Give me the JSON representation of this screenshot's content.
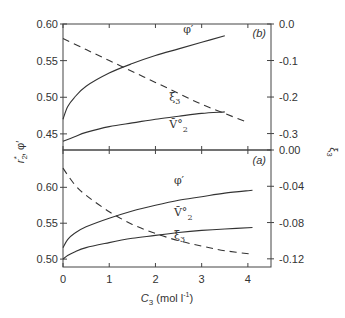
{
  "chart_data": [
    {
      "panel": "(b)",
      "type": "line",
      "xlabel": "C3 (mol l-1)",
      "xlim": [
        0,
        4.5
      ],
      "x_ticks": [
        0,
        1,
        2,
        3,
        4
      ],
      "ylabel_left": "r*2, φ′",
      "ylim_left": [
        0.428,
        0.6
      ],
      "y_ticks_left": [
        "0.60",
        "0.55",
        "0.50",
        "0.45"
      ],
      "ylabel_right": "ξ3",
      "ylim_right": [
        -0.345,
        0.0
      ],
      "y_ticks_right": [
        "0.0",
        "-0.1",
        "-0.2",
        "-0.3"
      ],
      "series": [
        {
          "name": "φ′",
          "axis": "left",
          "style": "solid",
          "x": [
            0,
            0.1,
            0.25,
            0.5,
            1.0,
            1.5,
            2.0,
            2.5,
            3.0,
            3.5
          ],
          "y": [
            0.47,
            0.487,
            0.5,
            0.515,
            0.533,
            0.546,
            0.557,
            0.566,
            0.575,
            0.584
          ]
        },
        {
          "name": "ξ3",
          "axis": "right",
          "style": "dashed",
          "x": [
            0,
            0.5,
            1.0,
            1.5,
            2.0,
            2.5,
            3.0,
            3.5,
            4.0
          ],
          "y": [
            -0.04,
            -0.07,
            -0.1,
            -0.13,
            -0.16,
            -0.19,
            -0.22,
            -0.245,
            -0.27
          ]
        },
        {
          "name": "V̄°2",
          "axis": "left",
          "style": "solid",
          "x": [
            0,
            0.25,
            0.5,
            1.0,
            1.5,
            2.0,
            2.5,
            3.0,
            3.5
          ],
          "y": [
            0.44,
            0.446,
            0.452,
            0.46,
            0.465,
            0.47,
            0.474,
            0.478,
            0.48
          ]
        }
      ],
      "annotations": [
        {
          "text": "φ′",
          "x": 2.6,
          "y": 0.588
        },
        {
          "text": "ξ3",
          "x": 2.3,
          "y": 0.495
        },
        {
          "text": "V̄°2",
          "x": 2.3,
          "y": 0.458
        },
        {
          "text": "(b)",
          "x": 4.1,
          "y": 0.582
        }
      ]
    },
    {
      "panel": "(a)",
      "type": "line",
      "xlabel": "C3 (mol l-1)",
      "xlim": [
        0,
        4.5
      ],
      "x_ticks": [
        0,
        1,
        2,
        3,
        4
      ],
      "ylabel_left": "r*2, φ′",
      "ylim_left": [
        0.489,
        0.652
      ],
      "y_ticks_left": [
        "0.60",
        "0.55",
        "0.50"
      ],
      "ylabel_right": "ξ3",
      "ylim_right": [
        -0.129,
        0.0
      ],
      "y_ticks_right": [
        "0.00",
        "-0.04",
        "-0.08",
        "-0.12"
      ],
      "series": [
        {
          "name": "φ′",
          "axis": "left",
          "style": "solid",
          "x": [
            0,
            0.1,
            0.25,
            0.5,
            1.0,
            1.5,
            2.0,
            2.5,
            3.0,
            3.5,
            4.1
          ],
          "y": [
            0.516,
            0.527,
            0.536,
            0.545,
            0.557,
            0.567,
            0.575,
            0.582,
            0.587,
            0.592,
            0.596
          ]
        },
        {
          "name": "V̄°2",
          "axis": "left",
          "style": "solid",
          "x": [
            0,
            0.1,
            0.25,
            0.5,
            1.0,
            1.5,
            2.0,
            2.5,
            3.0,
            3.5,
            4.1
          ],
          "y": [
            0.5,
            0.505,
            0.51,
            0.516,
            0.523,
            0.529,
            0.533,
            0.537,
            0.54,
            0.542,
            0.544
          ]
        },
        {
          "name": "ξ3",
          "axis": "right",
          "style": "dashed",
          "x": [
            0,
            0.25,
            0.5,
            1.0,
            1.5,
            2.0,
            2.5,
            3.0,
            3.5,
            4.1
          ],
          "y": [
            -0.02,
            -0.038,
            -0.05,
            -0.068,
            -0.082,
            -0.092,
            -0.1,
            -0.106,
            -0.111,
            -0.115
          ]
        }
      ],
      "annotations": [
        {
          "text": "φ′",
          "x": 2.4,
          "y": 0.605
        },
        {
          "text": "V̄°2",
          "x": 2.4,
          "y": 0.56
        },
        {
          "text": "ξ3",
          "x": 2.4,
          "y": 0.528
        },
        {
          "text": "(a)",
          "x": 4.1,
          "y": 0.632
        }
      ]
    }
  ],
  "labels": {
    "panel_b": "(b)",
    "panel_a": "(a)",
    "left_axis_title": "r*2, φ′",
    "right_axis_title": "ξ3",
    "x_axis_title_var": "C",
    "x_axis_title_sub": "3",
    "x_axis_title_unit": " (mol l",
    "x_axis_title_sup": "-1",
    "x_axis_title_close": ")"
  }
}
